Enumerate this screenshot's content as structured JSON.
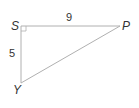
{
  "diagram": {
    "type": "right-triangle",
    "vertices": {
      "S": {
        "label": "S",
        "x": 21,
        "y": 26
      },
      "P": {
        "label": "P",
        "x": 120,
        "y": 26
      },
      "Y": {
        "label": "Y",
        "x": 21,
        "y": 83
      }
    },
    "sides": {
      "SP": {
        "label": "9"
      },
      "SY": {
        "label": "5"
      }
    },
    "right_angle_at": "S",
    "line_color": "#b0b0b0",
    "text_color": "#333333"
  }
}
